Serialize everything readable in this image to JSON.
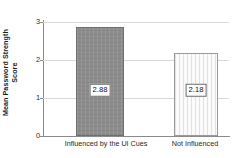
{
  "chart_data": {
    "type": "bar",
    "title": "",
    "xlabel": "",
    "ylabel": "Mean Password Strength Score",
    "ylabel_line1": "Mean Password Strength",
    "ylabel_line2": "Score",
    "categories": [
      "Influenced by the UI Cues",
      "Not Influenced"
    ],
    "values": [
      2.88,
      2.18
    ],
    "value_labels": [
      "2.88",
      "2.18"
    ],
    "ylim": [
      0,
      3
    ],
    "yticks": [
      0,
      1,
      2,
      3
    ],
    "ytick_labels": [
      "0",
      "1",
      "2",
      "3"
    ],
    "grid": true,
    "grid_axis": "y",
    "legend": false,
    "legend_position": "none",
    "bar_styles": [
      {
        "name": "influenced-bar",
        "fill": "#8c8c8c",
        "edge": "#6f6f6f",
        "pattern": "cross-hatch"
      },
      {
        "name": "not-influenced-bar",
        "fill": "#fbfbfb",
        "edge": "#9a9a9a",
        "pattern": "vertical-stripes"
      }
    ]
  },
  "colors": {
    "background": "#ffffff",
    "gridline": "#d9d9d9",
    "axis": "#8a8a8a",
    "text": "#1f1f1f",
    "bar_dark": "#8c8c8c",
    "bar_light": "#fbfbfb"
  }
}
